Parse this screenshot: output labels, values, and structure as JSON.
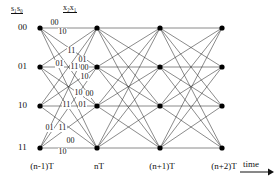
{
  "figure": {
    "type": "trellis-diagram",
    "title_labels": {
      "state_header": "s₁s₀",
      "state_header_parts": {
        "base": "s",
        "sub1": "1",
        "base2": "s",
        "sub2": "0"
      },
      "branch_header": "x₂x₁",
      "branch_header_parts": {
        "base": "x",
        "sub1": "2",
        "base2": "x",
        "sub2": "1"
      }
    },
    "axis": {
      "time_label": "time",
      "arrow": "right-arrow"
    },
    "states": [
      {
        "id": "s00",
        "label": "00",
        "row": 0,
        "y": 28
      },
      {
        "id": "s01",
        "label": "01",
        "row": 1,
        "y": 67
      },
      {
        "id": "s10",
        "label": "10",
        "row": 2,
        "y": 106
      },
      {
        "id": "s11",
        "label": "11",
        "row": 3,
        "y": 148
      }
    ],
    "stages": [
      {
        "id": "t0",
        "label": "(n-1)T",
        "x": 40
      },
      {
        "id": "t1",
        "label": "nT",
        "x": 97
      },
      {
        "id": "t2",
        "label": "(n+1)T",
        "x": 160
      },
      {
        "id": "t3",
        "label": "(n+2)T",
        "x": 222
      }
    ],
    "fully_connected": true,
    "edge_labels": [
      {
        "text": "00",
        "x": 50,
        "y": 19
      },
      {
        "text": "10",
        "x": 58,
        "y": 28
      },
      {
        "text": "11",
        "x": 67,
        "y": 47
      },
      {
        "text": "01",
        "x": 78,
        "y": 56
      },
      {
        "text": "01",
        "x": 55,
        "y": 60
      },
      {
        "text": "11",
        "x": 70,
        "y": 63
      },
      {
        "text": "00",
        "x": 80,
        "y": 64
      },
      {
        "text": "10",
        "x": 80,
        "y": 73
      },
      {
        "text": "10",
        "x": 74,
        "y": 89
      },
      {
        "text": "00",
        "x": 85,
        "y": 90
      },
      {
        "text": "11",
        "x": 62,
        "y": 101
      },
      {
        "text": "01",
        "x": 78,
        "y": 101
      },
      {
        "text": "01",
        "x": 45,
        "y": 124
      },
      {
        "text": "11",
        "x": 58,
        "y": 124
      },
      {
        "text": "00",
        "x": 66,
        "y": 137
      },
      {
        "text": "10",
        "x": 58,
        "y": 148
      }
    ],
    "colors": {
      "line": "#2b2b2b",
      "node": "#000000",
      "text": "#111111",
      "background": "#ffffff"
    }
  }
}
